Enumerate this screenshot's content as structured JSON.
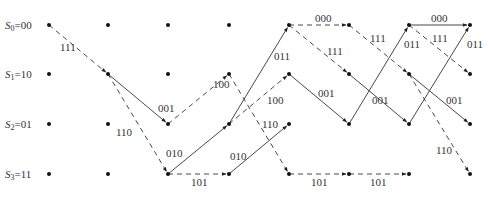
{
  "diagram": {
    "type": "trellis",
    "columns_x": [
      21,
      108,
      168,
      229,
      289,
      349,
      409,
      470
    ],
    "rows_y": [
      25,
      74,
      124,
      174
    ],
    "states": [
      {
        "id": "S0",
        "label_sym": "S",
        "label_sub": "0",
        "label_val": "=00"
      },
      {
        "id": "S1",
        "label_sym": "S",
        "label_sub": "1",
        "label_val": "=10"
      },
      {
        "id": "S2",
        "label_sym": "S",
        "label_sub": "2",
        "label_val": "=01"
      },
      {
        "id": "S3",
        "label_sym": "S",
        "label_sub": "3",
        "label_val": "=11"
      }
    ],
    "edges": [
      {
        "from": [
          0,
          0
        ],
        "to": [
          1,
          1
        ],
        "style": "dashed",
        "label": "111",
        "lx": 60,
        "ly": 51
      },
      {
        "from": [
          1,
          1
        ],
        "to": [
          2,
          2
        ],
        "style": "solid",
        "label": "001",
        "lx": 158,
        "ly": 112
      },
      {
        "from": [
          1,
          1
        ],
        "to": [
          2,
          3
        ],
        "style": "dashed",
        "label": "110",
        "lx": 116,
        "ly": 136
      },
      {
        "from": [
          2,
          2
        ],
        "to": [
          3,
          1
        ],
        "style": "dashed",
        "label": "100",
        "lx": 213,
        "ly": 88
      },
      {
        "from": [
          2,
          3
        ],
        "to": [
          3,
          2
        ],
        "style": "solid",
        "label": "010",
        "lx": 166,
        "ly": 157
      },
      {
        "from": [
          2,
          3
        ],
        "to": [
          3,
          3
        ],
        "style": "dashed",
        "label": "101",
        "lx": 191,
        "ly": 186
      },
      {
        "from": [
          3,
          1
        ],
        "to": [
          4,
          3
        ],
        "style": "dashed",
        "label": "",
        "lx": 0,
        "ly": 0
      },
      {
        "from": [
          3,
          2
        ],
        "to": [
          4,
          0
        ],
        "style": "solid",
        "label": "011",
        "lx": 274,
        "ly": 60
      },
      {
        "from": [
          3,
          2
        ],
        "to": [
          4,
          1
        ],
        "style": "dashed",
        "label": "100",
        "lx": 267,
        "ly": 104
      },
      {
        "from": [
          3,
          3
        ],
        "to": [
          4,
          2
        ],
        "style": "solid",
        "label": "010",
        "lx": 230,
        "ly": 160
      },
      {
        "from": [
          4,
          0
        ],
        "to": [
          5,
          0
        ],
        "style": "dashed",
        "label": "000",
        "lx": 315,
        "ly": 22
      },
      {
        "from": [
          4,
          0
        ],
        "to": [
          5,
          1
        ],
        "style": "dashed",
        "label": "111",
        "lx": 327,
        "ly": 55
      },
      {
        "from": [
          4,
          1
        ],
        "to": [
          5,
          2
        ],
        "style": "solid",
        "label": "001",
        "lx": 318,
        "ly": 97
      },
      {
        "from": [
          4,
          3
        ],
        "to": [
          5,
          3
        ],
        "style": "dashed",
        "label": "101",
        "lx": 311,
        "ly": 186
      },
      {
        "from": [
          5,
          0
        ],
        "to": [
          6,
          1
        ],
        "style": "dashed",
        "label": "111",
        "lx": 370,
        "ly": 42
      },
      {
        "from": [
          5,
          1
        ],
        "to": [
          6,
          2
        ],
        "style": "solid",
        "label": "001",
        "lx": 372,
        "ly": 104
      },
      {
        "from": [
          5,
          3
        ],
        "to": [
          6,
          3
        ],
        "style": "dashed",
        "label": "101",
        "lx": 370,
        "ly": 186
      },
      {
        "from": [
          5,
          2
        ],
        "to": [
          6,
          0
        ],
        "style": "solid",
        "label": "011",
        "lx": 404,
        "ly": 48
      },
      {
        "from": [
          6,
          0
        ],
        "to": [
          7,
          0
        ],
        "style": "solid",
        "label": "000",
        "lx": 431,
        "ly": 22
      },
      {
        "from": [
          6,
          0
        ],
        "to": [
          7,
          1
        ],
        "style": "dashed",
        "label": "111",
        "lx": 432,
        "ly": 42
      },
      {
        "from": [
          6,
          1
        ],
        "to": [
          7,
          2
        ],
        "style": "solid",
        "label": "001",
        "lx": 446,
        "ly": 104
      },
      {
        "from": [
          6,
          1
        ],
        "to": [
          7,
          3
        ],
        "style": "dashed",
        "label": "110",
        "lx": 436,
        "ly": 154
      },
      {
        "from": [
          6,
          2
        ],
        "to": [
          7,
          0
        ],
        "style": "solid",
        "label": "011",
        "lx": 467,
        "ly": 48
      }
    ],
    "extra_labels": [
      {
        "text": "110",
        "x": 262,
        "y": 128
      }
    ]
  }
}
